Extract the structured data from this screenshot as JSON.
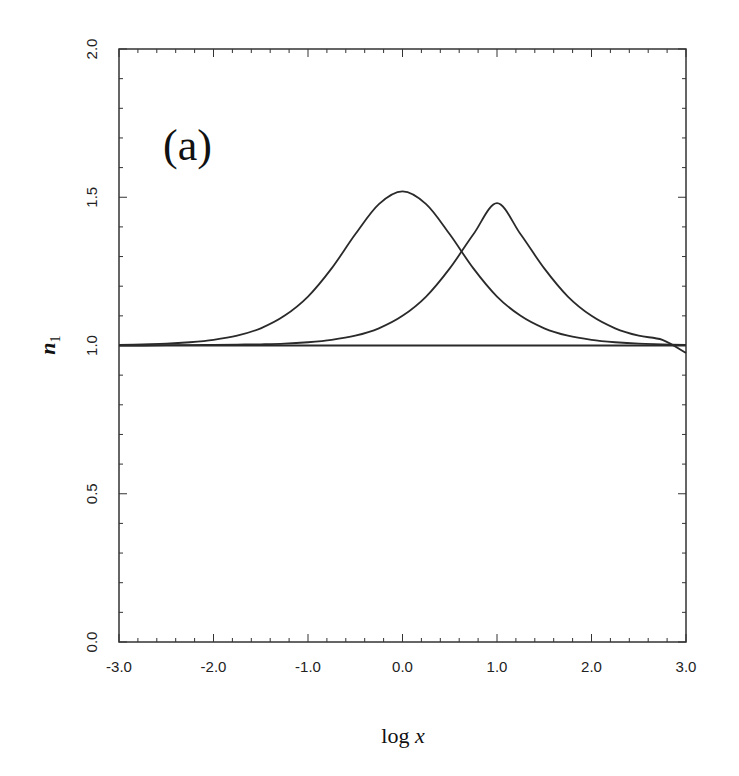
{
  "chart_data": {
    "type": "line",
    "title": "",
    "panel_label": "(a)",
    "xlabel": "log x",
    "ylabel": "n1",
    "xlim": [
      -3.0,
      3.0
    ],
    "ylim": [
      0.0,
      2.0
    ],
    "xticks": [
      -3.0,
      -2.0,
      -1.0,
      0.0,
      1.0,
      2.0,
      3.0
    ],
    "xtick_labels": [
      "-3.0",
      "-2.0",
      "-1.0",
      "0.0",
      "1.0",
      "2.0",
      "3.0"
    ],
    "yticks": [
      0.0,
      0.5,
      1.0,
      1.5,
      2.0
    ],
    "ytick_labels": [
      "0.0",
      "0.5",
      "1.0",
      "1.5",
      "2.0"
    ],
    "x_minor_step": 0.2,
    "y_minor_step": 0.1,
    "grid": false,
    "legend": null,
    "series": [
      {
        "name": "upper curve",
        "x": [
          -3.0,
          -2.75,
          -2.5,
          -2.25,
          -2.0,
          -1.75,
          -1.5,
          -1.25,
          -1.0,
          -0.75,
          -0.5,
          -0.25,
          0.0,
          0.25,
          0.5,
          0.75,
          1.0,
          1.25,
          1.5,
          1.75,
          2.0,
          2.25,
          2.5,
          2.75,
          3.0
        ],
        "y": [
          1.002,
          1.004,
          1.006,
          1.011,
          1.019,
          1.033,
          1.058,
          1.1,
          1.165,
          1.26,
          1.375,
          1.477,
          1.52,
          1.477,
          1.375,
          1.26,
          1.165,
          1.1,
          1.058,
          1.033,
          1.019,
          1.011,
          1.006,
          1.004,
          1.002
        ]
      },
      {
        "name": "flat line",
        "x": [
          -3.0,
          3.0
        ],
        "y": [
          1.0,
          1.0
        ]
      },
      {
        "name": "lower curve",
        "x": [
          -3.0,
          -2.75,
          -2.5,
          -2.25,
          -2.0,
          -1.75,
          -1.5,
          -1.25,
          -1.0,
          -0.75,
          -0.5,
          -0.25,
          0.0,
          0.25,
          0.5,
          0.75,
          1.0,
          1.25,
          1.5,
          1.75,
          2.0,
          2.25,
          2.5,
          2.75,
          3.0
        ],
        "y": [
          1.0,
          1.0,
          1.001,
          1.001,
          1.002,
          1.003,
          1.004,
          1.006,
          1.011,
          1.019,
          1.033,
          1.058,
          1.1,
          1.165,
          1.26,
          1.375,
          1.48,
          1.375,
          1.26,
          1.165,
          1.1,
          1.058,
          1.033,
          1.019,
          0.975
        ]
      }
    ]
  },
  "colors": {
    "line": "#2a2a2a",
    "axis": "#333333",
    "background": "#ffffff"
  },
  "layout": {
    "plot_left": 119,
    "plot_right": 686,
    "plot_top": 49,
    "plot_bottom": 642
  }
}
